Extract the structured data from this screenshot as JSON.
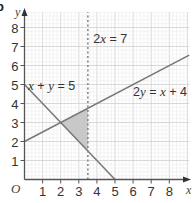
{
  "chart_data": {
    "type": "line",
    "title": "",
    "corner_label": "b",
    "xlabel": "x",
    "ylabel": "y",
    "origin_label": "O",
    "xlim": [
      0,
      9.1
    ],
    "ylim": [
      0,
      8.8
    ],
    "x_ticks": [
      1,
      2,
      3,
      4,
      5,
      6,
      7,
      8
    ],
    "y_ticks": [
      1,
      2,
      3,
      4,
      5,
      6,
      7,
      8
    ],
    "grid": {
      "major": 1,
      "minor": 0.2,
      "on": true
    },
    "series": [
      {
        "name": "x + y = 5",
        "style": "solid",
        "points": [
          [
            0,
            5
          ],
          [
            5,
            0
          ]
        ],
        "label": {
          "parts": [
            [
              "x",
              true
            ],
            [
              " + ",
              false
            ],
            [
              "y",
              true
            ],
            [
              " = 5",
              false
            ]
          ],
          "at": [
            0.2,
            4.7
          ]
        }
      },
      {
        "name": "2y = x + 4",
        "style": "solid",
        "points": [
          [
            0,
            2
          ],
          [
            9.1,
            6.55
          ]
        ],
        "label": {
          "parts": [
            [
              "2",
              false
            ],
            [
              "y",
              true
            ],
            [
              " = ",
              false
            ],
            [
              "x",
              true
            ],
            [
              " + 4",
              false
            ]
          ],
          "at": [
            6.0,
            4.4
          ]
        }
      },
      {
        "name": "2x = 7",
        "style": "dashed",
        "points": [
          [
            3.5,
            0
          ],
          [
            3.5,
            8.8
          ]
        ],
        "label": {
          "parts": [
            [
              "2",
              false
            ],
            [
              "x",
              true
            ],
            [
              " = 7",
              false
            ]
          ],
          "at": [
            3.8,
            7.2
          ]
        }
      }
    ],
    "shaded_region": {
      "vertices": [
        [
          2,
          3
        ],
        [
          3.5,
          3.75
        ],
        [
          3.5,
          1.5
        ]
      ],
      "color": "#c8c8c8"
    },
    "colors": {
      "grid_major": "#cfcfcf",
      "grid_minor": "#ececec",
      "axis": "#555555",
      "line": "#777777",
      "dashed": "#888888"
    }
  }
}
